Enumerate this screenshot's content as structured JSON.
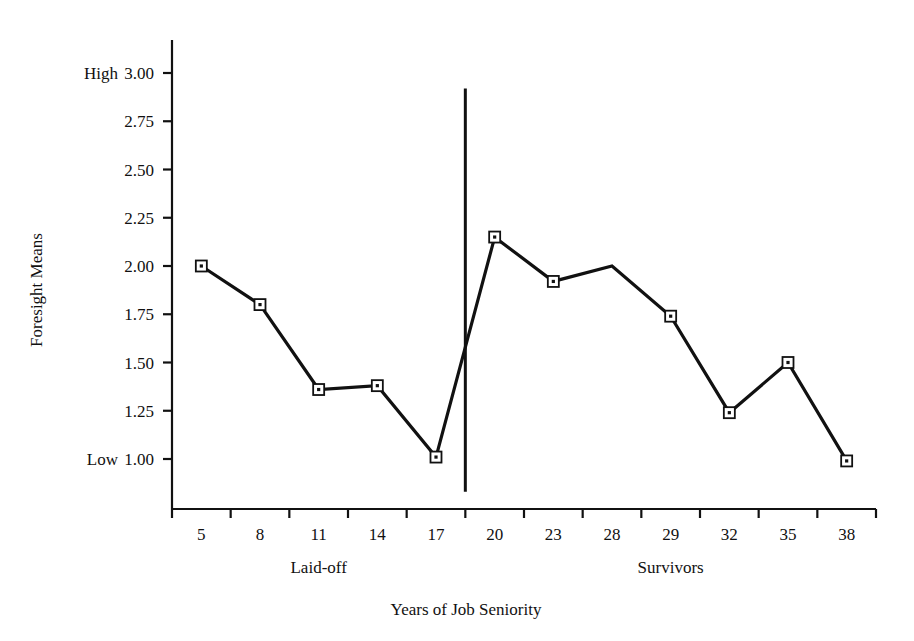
{
  "chart_data": {
    "type": "line",
    "title": "",
    "subtitle": "",
    "xlabel": "Years of Job Seniority",
    "ylabel": "Foresight Means",
    "categories": [
      "5",
      "8",
      "11",
      "14",
      "17",
      "20",
      "23",
      "28",
      "29",
      "32",
      "35",
      "38"
    ],
    "values": [
      2.0,
      1.8,
      1.36,
      1.38,
      1.01,
      2.15,
      1.92,
      2.0,
      1.74,
      1.24,
      1.5,
      0.99
    ],
    "series": [
      {
        "name": "Foresight Means",
        "values": [
          2.0,
          1.8,
          1.36,
          1.38,
          1.01,
          2.15,
          1.92,
          2.0,
          1.74,
          1.24,
          1.5,
          0.99
        ]
      }
    ],
    "markers_shown": [
      true,
      true,
      true,
      true,
      true,
      true,
      true,
      false,
      true,
      true,
      true,
      true
    ],
    "ylim": [
      0.8,
      3.05
    ],
    "yticks": [
      "3.00",
      "2.75",
      "2.50",
      "2.25",
      "2.00",
      "1.75",
      "1.50",
      "1.25",
      "1.00"
    ],
    "ytick_values": [
      3.0,
      2.75,
      2.5,
      2.25,
      2.0,
      1.75,
      1.5,
      1.25,
      1.0
    ],
    "y_high_anchor": "High",
    "y_low_anchor": "Low",
    "y_high_anchor_value": 3.0,
    "y_low_anchor_value": 1.0,
    "grid": false,
    "legend_position": "none",
    "line_color": "#111111",
    "marker_color": "#111111",
    "marker_shape": "open-square-with-dot",
    "divider": {
      "label": "group-divider",
      "between_categories": [
        "17",
        "20"
      ],
      "top_value": 2.92,
      "bottom_value": 0.83
    },
    "group_labels": [
      {
        "label": "Laid-off",
        "categories": [
          "5",
          "8",
          "11",
          "14",
          "17"
        ]
      },
      {
        "label": "Survivors",
        "categories": [
          "20",
          "23",
          "28",
          "29",
          "32",
          "35",
          "38"
        ]
      }
    ]
  },
  "axes": {
    "y_axis_name": "foresight-means-axis",
    "x_axis_name": "years-of-job-seniority-axis"
  }
}
